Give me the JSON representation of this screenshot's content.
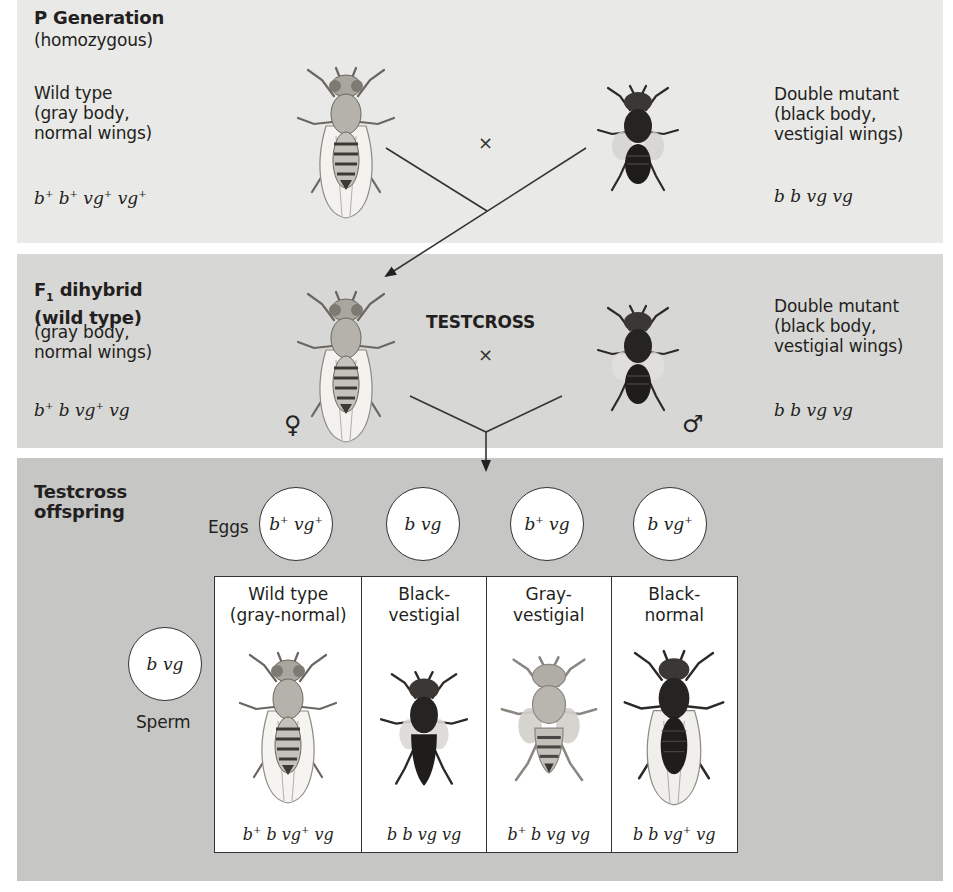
{
  "p_generation": {
    "title": "P Generation",
    "subtitle": "(homozygous)",
    "left": {
      "phenotype_lines": [
        "Wild type",
        "(gray body,",
        "normal wings)"
      ],
      "genotype": [
        {
          "t": "b",
          "s": "+"
        },
        {
          "t": " b",
          "s": "+"
        },
        {
          "t": " vg",
          "s": "+"
        },
        {
          "t": " vg",
          "s": "+"
        }
      ],
      "genotype_text": "b+ b+ vg+ vg+",
      "fly": "wild-type-fly"
    },
    "cross_symbol": "×",
    "right": {
      "phenotype_lines": [
        "Double mutant",
        "(black body,",
        "vestigial wings)"
      ],
      "genotype_text": "b b vg vg",
      "fly": "black-vestigial-fly"
    }
  },
  "f1_generation": {
    "title_line1": "F",
    "title_sub": "1",
    "title_line1_rest": " dihybrid",
    "title_line2": "(wild type)",
    "phenotype_lines": [
      "(gray body,",
      "normal wings)"
    ],
    "genotype_text": "b+ b vg+ vg",
    "female_symbol": "♀",
    "male_symbol": "♂",
    "testcross_label": "TESTCROSS",
    "cross_symbol": "×",
    "right": {
      "phenotype_lines": [
        "Double mutant",
        "(black body,",
        "vestigial wings)"
      ],
      "genotype_text": "b b vg vg"
    }
  },
  "offspring": {
    "title_lines": [
      "Testcross",
      "offspring"
    ],
    "eggs_label": "Eggs",
    "sperm_label": "Sperm",
    "eggs": [
      {
        "parts": [
          [
            "b",
            "+"
          ],
          [
            " vg",
            "+"
          ]
        ],
        "text": "b+ vg+"
      },
      {
        "parts": [
          [
            "b",
            ""
          ],
          [
            " vg",
            ""
          ]
        ],
        "text": "b vg"
      },
      {
        "parts": [
          [
            "b",
            "+"
          ],
          [
            " vg",
            ""
          ]
        ],
        "text": "b+ vg"
      },
      {
        "parts": [
          [
            "b",
            ""
          ],
          [
            " vg",
            "+"
          ]
        ],
        "text": "b vg+"
      }
    ],
    "sperm": {
      "parts": [
        [
          "b",
          ""
        ],
        [
          " vg",
          ""
        ]
      ],
      "text": "b vg"
    },
    "cells": [
      {
        "phenotype_lines": [
          "Wild type",
          "(gray-normal)"
        ],
        "genotype_text": "b+ b vg+ vg",
        "parts": [
          [
            "b",
            "+"
          ],
          [
            " b",
            ""
          ],
          [
            " vg",
            "+"
          ],
          [
            " vg",
            ""
          ]
        ],
        "body": "gray",
        "wings": "normal"
      },
      {
        "phenotype_lines": [
          "Black-",
          "vestigial"
        ],
        "genotype_text": "b b vg vg",
        "parts": [
          [
            "b",
            ""
          ],
          [
            " b",
            ""
          ],
          [
            " vg",
            ""
          ],
          [
            " vg",
            ""
          ]
        ],
        "body": "black",
        "wings": "vestigial"
      },
      {
        "phenotype_lines": [
          "Gray-",
          "vestigial"
        ],
        "genotype_text": "b+ b vg vg",
        "parts": [
          [
            "b",
            "+"
          ],
          [
            " b",
            ""
          ],
          [
            " vg",
            ""
          ],
          [
            " vg",
            ""
          ]
        ],
        "body": "gray",
        "wings": "vestigial"
      },
      {
        "phenotype_lines": [
          "Black-",
          "normal"
        ],
        "genotype_text": "b b vg+ vg",
        "parts": [
          [
            "b",
            ""
          ],
          [
            " b",
            ""
          ],
          [
            " vg",
            "+"
          ],
          [
            " vg",
            ""
          ]
        ],
        "body": "black",
        "wings": "normal"
      }
    ]
  },
  "colors": {
    "panel_p": "#e9e9e7",
    "panel_f1": "#d7d7d5",
    "panel_offspring": "#c6c6c4",
    "text": "#231f20",
    "gray_body": "#9a9791",
    "black_body": "#2a2726"
  }
}
